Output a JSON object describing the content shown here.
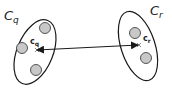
{
  "diagram": {
    "clusters": [
      {
        "id": "q",
        "label_main": "C",
        "label_sub": "q",
        "centroid_main": "c",
        "centroid_sub": "q",
        "ellipse": {
          "cx": 35,
          "cy": 52,
          "rx": 19,
          "ry": 34,
          "rotate": 22
        },
        "points": [
          {
            "cx": 45,
            "cy": 28
          },
          {
            "cx": 23,
            "cy": 48
          },
          {
            "cx": 36,
            "cy": 70
          }
        ],
        "centroid": {
          "x": 38,
          "y": 50
        }
      },
      {
        "id": "r",
        "label_main": "C",
        "label_sub": "r",
        "centroid_main": "c",
        "centroid_sub": "r",
        "ellipse": {
          "cx": 138,
          "cy": 46,
          "rx": 18,
          "ry": 36,
          "rotate": -18
        },
        "points": [
          {
            "cx": 135,
            "cy": 33
          },
          {
            "cx": 147,
            "cy": 57
          }
        ],
        "centroid": {
          "x": 137,
          "y": 45
        }
      }
    ],
    "connector": {
      "type": "double-arrow",
      "from": "c_q",
      "to": "c_r"
    },
    "colors": {
      "stroke": "#1a1a1a",
      "point_fill": "#c8c8c8",
      "point_stroke": "#444444",
      "background": "#ffffff"
    }
  }
}
